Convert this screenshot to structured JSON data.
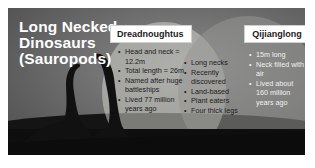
{
  "slide": {
    "title": "Long Necked Dinosaurs (Sauropods)",
    "title_lines": [
      "Long Necked",
      "Dinosaurs",
      "(Sauropods)"
    ],
    "background_color": "#6e6e6e",
    "title_color": "#ffffff"
  },
  "venn": {
    "left": {
      "label": "Dreadnoughtus",
      "items": [
        "Head and neck = 12.2m",
        "Total length = 26m",
        "Named after huge battleships",
        "Lived 77 million years ago"
      ]
    },
    "overlap": {
      "items": [
        "Long necks",
        "Recently discovered",
        "Land-based",
        "Plant eaters",
        "Four thick legs"
      ]
    },
    "right": {
      "label": "Qijianglong",
      "items": [
        "15m long",
        "Neck filled with air",
        "Lived about 160 million years ago"
      ]
    }
  },
  "illustration": {
    "icon": "sauropod-silhouette-icon"
  }
}
